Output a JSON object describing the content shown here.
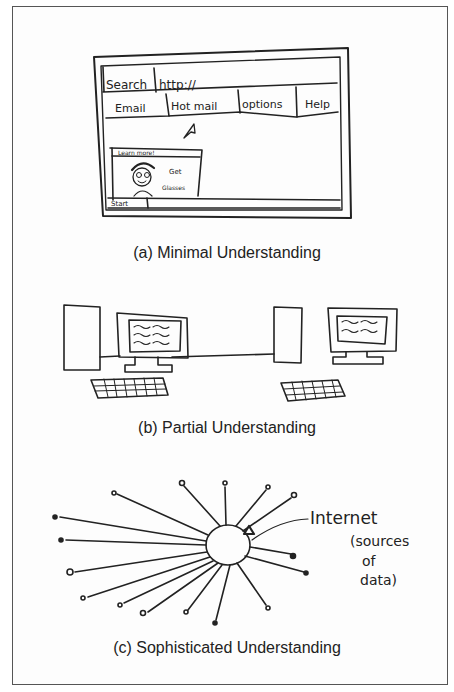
{
  "panels": [
    {
      "id": "a",
      "caption": "(a) Minimal Understanding",
      "sketch": {
        "browser": {
          "search_label": "Search",
          "url_text": "http://",
          "menu_items": [
            "Email",
            "Hot mail",
            "options",
            "Help"
          ],
          "ad_banner": "Learn more!",
          "ad_text_line1": "Get",
          "ad_text_line2": "Glasses",
          "start_button": "Start"
        }
      }
    },
    {
      "id": "b",
      "caption": "(b) Partial Understanding"
    },
    {
      "id": "c",
      "caption": "(c) Sophisticated Understanding",
      "annotation": {
        "line1": "Internet",
        "line2": "(sources",
        "line3": "of",
        "line4": "data)"
      }
    }
  ]
}
